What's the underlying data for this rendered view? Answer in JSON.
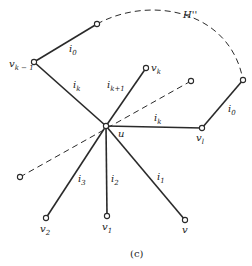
{
  "figure": {
    "caption": "(c)",
    "arc_label": "H''",
    "nodes": {
      "u": {
        "name": "u",
        "sub": ""
      },
      "v_k_minus_1": {
        "name": "v",
        "sub": "k − 1"
      },
      "v_k": {
        "name": "v",
        "sub": "k"
      },
      "v_l": {
        "name": "v",
        "sub": "l"
      },
      "v_1": {
        "name": "v",
        "sub": "1"
      },
      "v_2": {
        "name": "v",
        "sub": "2"
      },
      "v": {
        "name": "v",
        "sub": ""
      }
    },
    "edges": {
      "i0_left": {
        "name": "i",
        "sub": "0"
      },
      "ik_left": {
        "name": "i",
        "sub": "k"
      },
      "ik1": {
        "name": "i",
        "sub": "k+1"
      },
      "ik_right": {
        "name": "i",
        "sub": "k"
      },
      "i0_right": {
        "name": "i",
        "sub": "0"
      },
      "i1": {
        "name": "i",
        "sub": "1"
      },
      "i2": {
        "name": "i",
        "sub": "2"
      },
      "i3": {
        "name": "i",
        "sub": "3"
      }
    }
  }
}
